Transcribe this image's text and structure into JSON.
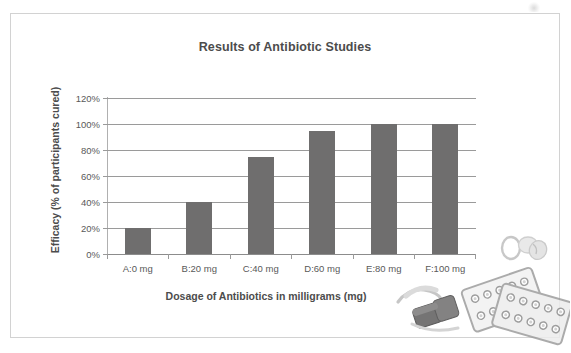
{
  "chart_data": {
    "type": "bar",
    "title": "Results of Antibiotic Studies",
    "xlabel": "Dosage of Antibiotics in milligrams (mg)",
    "ylabel": "Efficacy (% of participants cured)",
    "categories": [
      "A:0 mg",
      "B:20 mg",
      "C:40 mg",
      "D:60 mg",
      "E:80 mg",
      "F:100 mg"
    ],
    "values": [
      20,
      40,
      75,
      95,
      100,
      100
    ],
    "value_unit": "%",
    "ylim": [
      0,
      120
    ],
    "ytick_step": 20,
    "ytick_labels": [
      "0%",
      "20%",
      "40%",
      "60%",
      "80%",
      "100%",
      "120%"
    ],
    "ytick_values": [
      0,
      20,
      40,
      60,
      80,
      100,
      120
    ],
    "grid": true,
    "legend": false,
    "series": [
      {
        "name": "Efficacy",
        "values": [
          20,
          40,
          75,
          95,
          100,
          100
        ]
      }
    ],
    "colors": {
      "bar": "#6f6e6e",
      "gridline": "#9a9a9a",
      "axis": "#b0b0b0",
      "title_text": "#4c4c4c",
      "tick_text": "#595959",
      "frame_border": "#d2d2d2",
      "background": "#ffffff"
    }
  },
  "decorations": {
    "pill_blister_packs": "pill-blister-pack-image",
    "capsules": "capsule-pills-image",
    "scan_artifact": "scan-smudge-mark"
  }
}
